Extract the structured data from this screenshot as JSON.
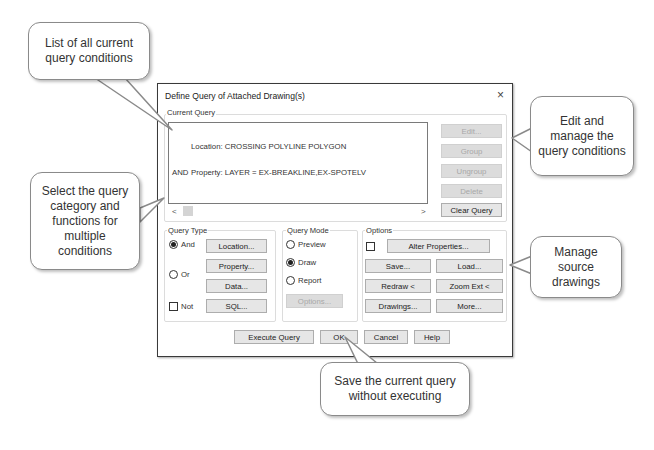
{
  "dialog": {
    "title": "Define Query of Attached Drawing(s)",
    "close_icon": "×",
    "current_query": {
      "label": "Current Query",
      "rows": [
        {
          "op": "",
          "text": "Location: CROSSING POLYLINE POLYGON"
        },
        {
          "op": "AND",
          "text": "Property: LAYER = EX-BREAKLINE,EX-SPOTELV"
        }
      ],
      "scroll_left": "<",
      "scroll_right": ">"
    },
    "edit_buttons": {
      "edit": "Edit...",
      "group": "Group",
      "ungroup": "Ungroup",
      "delete": "Delete",
      "clear_query": "Clear Query"
    },
    "query_type": {
      "label": "Query Type",
      "and_label": "And",
      "and_selected": true,
      "or_label": "Or",
      "or_selected": false,
      "not_label": "Not",
      "not_checked": false,
      "location": "Location...",
      "property": "Property...",
      "data": "Data...",
      "sql": "SQL..."
    },
    "query_mode": {
      "label": "Query Mode",
      "preview": "Preview",
      "draw": "Draw",
      "report": "Report",
      "selected": "Draw",
      "options": "Options..."
    },
    "options": {
      "label": "Options",
      "alter_checked": false,
      "alter_properties": "Alter Properties...",
      "save": "Save...",
      "load": "Load...",
      "redraw": "Redraw <",
      "zoom_ext": "Zoom Ext <",
      "drawings": "Drawings...",
      "more": "More..."
    },
    "footer": {
      "execute_query": "Execute Query",
      "ok": "OK",
      "cancel": "Cancel",
      "help": "Help"
    }
  },
  "callouts": {
    "list": "List of all current query conditions",
    "edit": "Edit and manage the query conditions",
    "select": "Select the query category and functions for multiple conditions",
    "manage": "Manage source drawings",
    "save": "Save the current query without executing"
  },
  "colors": {
    "button_bg": "#e6e6e6",
    "disabled_bg": "#dcdcdc",
    "disabled_text": "#a8a8a8",
    "callout_border": "#8a8a8a"
  }
}
